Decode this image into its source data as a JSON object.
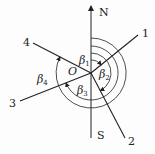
{
  "diagram": {
    "axis_north_label": "N",
    "axis_south_label": "S",
    "origin_label": "O",
    "lines": [
      {
        "label": "1"
      },
      {
        "label": "2"
      },
      {
        "label": "3"
      },
      {
        "label": "4"
      }
    ],
    "angles": [
      {
        "symbol": "β",
        "sub": "1"
      },
      {
        "symbol": "β",
        "sub": "2"
      },
      {
        "symbol": "β",
        "sub": "3"
      },
      {
        "symbol": "β",
        "sub": "4"
      }
    ],
    "stroke_color": "#222222"
  }
}
